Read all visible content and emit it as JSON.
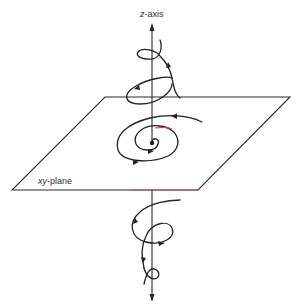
{
  "diagram": {
    "labels": {
      "z_axis_var": "z",
      "z_axis_suffix": "-axis",
      "plane_var": "xy",
      "plane_suffix": "-plane"
    },
    "elements": [
      {
        "id": "z-axis",
        "type": "arrow-line",
        "direction": "up and down"
      },
      {
        "id": "xy-plane",
        "type": "parallelogram"
      },
      {
        "id": "upper-helix",
        "type": "spiral curve",
        "location": "above plane"
      },
      {
        "id": "planar-spiral",
        "type": "spiral curve",
        "location": "in plane, converging to origin"
      },
      {
        "id": "lower-helix",
        "type": "spiral curve",
        "location": "below plane"
      }
    ],
    "colors": {
      "line": "#222222",
      "background": "#ffffff",
      "accent": "#d0405a"
    }
  }
}
